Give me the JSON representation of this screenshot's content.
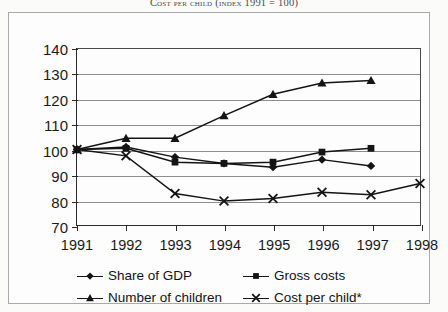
{
  "title": "Cost per child (index 1991 = 100)",
  "chart_data": {
    "type": "line",
    "title": "Cost per child (index 1991 = 100)",
    "xlabel": "",
    "ylabel": "",
    "x": [
      1991,
      1992,
      1993,
      1994,
      1995,
      1996,
      1997,
      1998
    ],
    "categories": [
      "1991",
      "1992",
      "1993",
      "1994",
      "1995",
      "1996",
      "1997",
      "1998"
    ],
    "xlim": [
      1991,
      1998
    ],
    "ylim": [
      70,
      140
    ],
    "yticks": [
      70,
      80,
      90,
      100,
      110,
      120,
      130,
      140
    ],
    "ytick_labels": [
      "70",
      "80",
      "90",
      "100",
      "110",
      "120",
      "130",
      "140"
    ],
    "grid": true,
    "grid_axis": "y",
    "legend_position": "bottom",
    "series": [
      {
        "name": "Share of GDP",
        "marker": "diamond",
        "x": [
          1991,
          1992,
          1993,
          1994,
          1995,
          1996,
          1997
        ],
        "values": [
          100,
          101,
          97,
          94.5,
          93,
          96,
          93.5
        ]
      },
      {
        "name": "Gross costs",
        "marker": "square",
        "x": [
          1991,
          1992,
          1993,
          1994,
          1995,
          1996,
          1997
        ],
        "values": [
          100,
          100.5,
          95,
          94.5,
          95,
          99,
          100.5
        ]
      },
      {
        "name": "Number of children",
        "marker": "triangle",
        "x": [
          1991,
          1992,
          1993,
          1994,
          1995,
          1996,
          1997
        ],
        "values": [
          100,
          104.5,
          104.5,
          113.5,
          122,
          126.5,
          127.5
        ]
      },
      {
        "name": "Cost per child*",
        "marker": "cross",
        "x": [
          1991,
          1992,
          1993,
          1994,
          1995,
          1996,
          1997,
          1998
        ],
        "values": [
          100,
          97.5,
          82.5,
          79.5,
          80.5,
          83,
          82,
          86.5
        ]
      }
    ]
  },
  "legend": {
    "items": [
      {
        "label": "Share of GDP",
        "marker": "diamond"
      },
      {
        "label": "Gross costs",
        "marker": "square"
      },
      {
        "label": "Number of children",
        "marker": "triangle"
      },
      {
        "label": "Cost per child*",
        "marker": "cross"
      }
    ]
  },
  "colors": {
    "ink": "#141414",
    "grid": "#8d8d8d",
    "axis": "#2b2b2b",
    "frame": "#a9a9a9",
    "background": "#fdfdfd"
  }
}
